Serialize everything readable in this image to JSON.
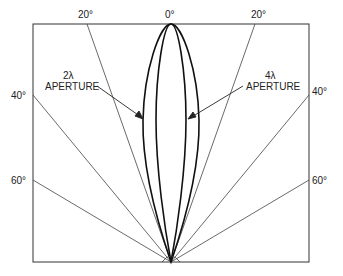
{
  "diagram": {
    "type": "antenna-radiation-pattern",
    "angle_labels": {
      "top_left_20": "20°",
      "top_center_0": "0°",
      "top_right_20": "20°",
      "left_40": "40°",
      "right_40": "40°",
      "left_60": "60°",
      "right_60": "60°"
    },
    "annotations": {
      "two_lambda_line1": "2λ",
      "two_lambda_line2": "APERTURE",
      "four_lambda_line1": "4λ",
      "four_lambda_line2": "APERTURE"
    },
    "lobes": [
      {
        "name": "2λ aperture",
        "relative_width": "wide"
      },
      {
        "name": "4λ aperture",
        "relative_width": "narrow"
      }
    ],
    "colors": {
      "line": "#222222",
      "background": "#ffffff"
    }
  }
}
